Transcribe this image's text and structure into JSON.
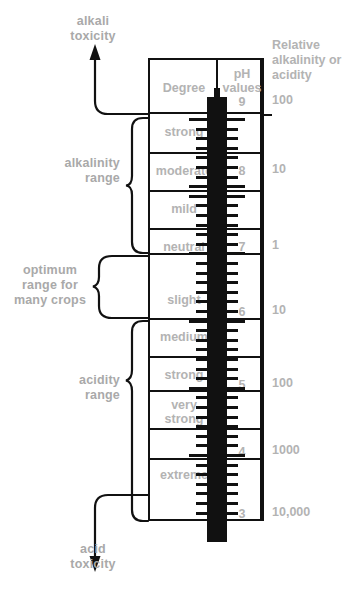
{
  "annotations": {
    "top_arrow_label": "alkali\ntoxicity",
    "bottom_arrow_label": "acid\ntoxicity",
    "alkalinity_brace": "alkalinity\nrange",
    "optimum_brace": "optimum\nrange for\nmany crops",
    "acidity_brace": "acidity\nrange"
  },
  "table": {
    "headers": {
      "degree": "Degree",
      "ph_values": "pH\nvalues",
      "relative": "Relative\nalkalinity\nor acidity"
    },
    "rows": [
      {
        "degree": "strong",
        "ph": "",
        "relative": ""
      },
      {
        "degree": "moderate",
        "ph": "8",
        "relative": "10"
      },
      {
        "degree": "mild",
        "ph": "",
        "relative": ""
      },
      {
        "degree": "neutral",
        "ph": "7",
        "relative": "1"
      },
      {
        "degree": "slight",
        "ph": "6",
        "relative": "10"
      },
      {
        "degree": "medium",
        "ph": "",
        "relative": ""
      },
      {
        "degree": "strong",
        "ph": "5",
        "relative": "100"
      },
      {
        "degree": "very\nstrong",
        "ph": "",
        "relative": ""
      },
      {
        "degree": "extreme",
        "ph": "4",
        "relative": "1000"
      },
      {
        "degree": "",
        "ph": "3",
        "relative": "10,000"
      }
    ],
    "top_scale": {
      "ph": "9",
      "relative": "100"
    }
  },
  "chart_data": {
    "type": "table",
    "ph_values": [
      9,
      8,
      7,
      6,
      5,
      4,
      3
    ],
    "relative_alkalinity_or_acidity": [
      "100",
      "10",
      "1",
      "10",
      "100",
      "1000",
      "10,000"
    ],
    "degree_labels": [
      "strong",
      "moderate",
      "mild",
      "neutral",
      "slight",
      "medium",
      "strong",
      "very strong",
      "extreme"
    ],
    "ranges": {
      "alkalinity_range": {
        "ph_from": 9,
        "ph_to": 7
      },
      "optimum_range_for_many_crops": {
        "ph_from": 7,
        "ph_to": 6
      },
      "acidity_range": {
        "ph_from": 6,
        "ph_to": 3
      }
    }
  },
  "colors": {
    "ink": "#111111",
    "text_gray": "#b3b3b3",
    "background": "#ffffff"
  }
}
